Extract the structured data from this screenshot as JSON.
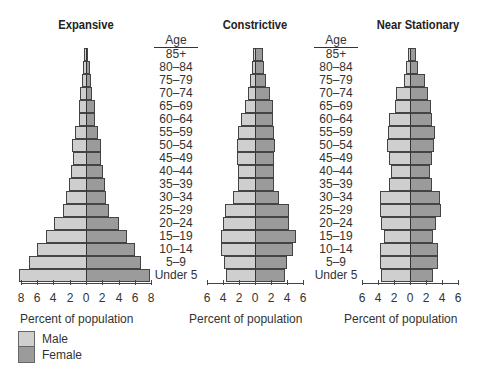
{
  "chart_data": [
    {
      "type": "bar",
      "subtype": "population-pyramid",
      "title": "Expansive",
      "xlabel": "Percent of population",
      "ylabel": "Age",
      "xlim": [
        -8,
        8
      ],
      "xticks": [
        "8",
        "6",
        "4",
        "2",
        "0",
        "2",
        "4",
        "6",
        "8"
      ],
      "categories": [
        "85+",
        "80–84",
        "75–79",
        "70–74",
        "65–69",
        "60–64",
        "55–59",
        "50–54",
        "45–49",
        "40–44",
        "35–39",
        "30–34",
        "25–29",
        "20–24",
        "15–19",
        "10–14",
        "5–9",
        "Under 5"
      ],
      "series": [
        {
          "name": "Male",
          "values": [
            0.3,
            0.4,
            0.5,
            0.7,
            0.9,
            0.9,
            1.3,
            1.7,
            1.6,
            1.8,
            2.1,
            2.4,
            2.8,
            3.9,
            4.9,
            6.0,
            7.0,
            8.2
          ]
        },
        {
          "name": "Female",
          "values": [
            0.3,
            0.5,
            0.6,
            0.7,
            1.1,
            1.1,
            1.5,
            1.8,
            1.8,
            2.1,
            2.3,
            2.5,
            2.8,
            4.1,
            5.0,
            6.0,
            6.8,
            7.8
          ]
        }
      ]
    },
    {
      "type": "bar",
      "subtype": "population-pyramid",
      "title": "Constrictive",
      "xlabel": "Percent of population",
      "ylabel": "Age",
      "xlim": [
        -6,
        6
      ],
      "xticks": [
        "6",
        "4",
        "2",
        "0",
        "2",
        "4",
        "6"
      ],
      "categories": [
        "85+",
        "80–84",
        "75–79",
        "70–74",
        "65–69",
        "60–64",
        "55–59",
        "50–54",
        "45–49",
        "40–44",
        "35–39",
        "30–34",
        "25–29",
        "20–24",
        "15–19",
        "10–14",
        "5–9",
        "Under 5"
      ],
      "series": [
        {
          "name": "Male",
          "values": [
            0.3,
            0.4,
            0.6,
            0.9,
            1.3,
            1.8,
            2.1,
            2.3,
            2.2,
            2.1,
            2.1,
            2.8,
            3.8,
            4.0,
            4.3,
            4.2,
            3.9,
            3.6
          ]
        },
        {
          "name": "Female",
          "values": [
            1.0,
            1.1,
            1.4,
            1.9,
            2.2,
            2.3,
            2.4,
            2.5,
            2.4,
            2.4,
            2.4,
            3.0,
            4.2,
            4.3,
            5.1,
            4.7,
            4.0,
            3.8
          ]
        }
      ]
    },
    {
      "type": "bar",
      "subtype": "population-pyramid",
      "title": "Near Stationary",
      "xlabel": "Percent of population",
      "ylabel": "Age",
      "xlim": [
        -6,
        6
      ],
      "xticks": [
        "6",
        "4",
        "2",
        "0",
        "2",
        "4",
        "6"
      ],
      "categories": [
        "85+",
        "80–84",
        "75–79",
        "70–74",
        "65–69",
        "60–64",
        "55–59",
        "50–54",
        "45–49",
        "40–44",
        "35–39",
        "30–34",
        "25–29",
        "20–24",
        "15–19",
        "10–14",
        "5–9",
        "Under 5"
      ],
      "series": [
        {
          "name": "Male",
          "values": [
            0.3,
            0.5,
            0.8,
            1.7,
            1.9,
            2.6,
            2.8,
            2.9,
            2.6,
            2.4,
            2.6,
            3.8,
            3.8,
            3.6,
            3.3,
            3.7,
            3.7,
            3.6
          ]
        },
        {
          "name": "Female",
          "values": [
            0.7,
            1.0,
            1.9,
            2.3,
            2.6,
            2.8,
            3.1,
            3.0,
            2.8,
            2.5,
            2.8,
            3.8,
            3.9,
            3.2,
            2.9,
            3.5,
            3.5,
            2.9
          ]
        }
      ]
    }
  ],
  "age_header": "Age",
  "age_labels": [
    "85+",
    "80–84",
    "75–79",
    "70–74",
    "65–69",
    "60–64",
    "55–59",
    "50–54",
    "45–49",
    "40–44",
    "35–39",
    "30–34",
    "25–29",
    "20–24",
    "15–19",
    "10–14",
    "5–9",
    "Under 5"
  ],
  "legend": {
    "items": [
      {
        "label": "Male",
        "color": "#cfcfcf"
      },
      {
        "label": "Female",
        "color": "#9b9b9b"
      }
    ]
  },
  "layout": {
    "pyramids": [
      {
        "center_x": 86,
        "px_per_pct": 8.15,
        "title_center": 86
      },
      {
        "center_x": 255,
        "px_per_pct": 8.0,
        "title_center": 255
      },
      {
        "center_x": 410,
        "px_per_pct": 8.0,
        "title_center": 418
      }
    ],
    "age_columns_x": [
      150,
      310
    ]
  }
}
